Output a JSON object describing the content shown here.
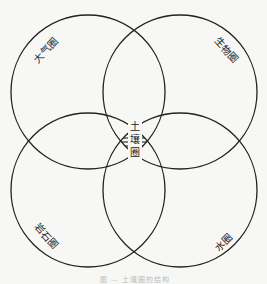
{
  "diagram": {
    "type": "venn-4-circle",
    "circles": [
      {
        "id": "atmosphere",
        "label": "大气圈",
        "cx": 88,
        "cy": 92,
        "r": 77
      },
      {
        "id": "biosphere",
        "label": "生物圈",
        "cx": 180,
        "cy": 92,
        "r": 77
      },
      {
        "id": "lithosphere",
        "label": "岩石圈",
        "cx": 88,
        "cy": 190,
        "r": 77
      },
      {
        "id": "hydrosphere",
        "label": "水圈",
        "cx": 180,
        "cy": 190,
        "r": 77
      }
    ],
    "center": {
      "label": "土壤圈",
      "chars": [
        "土",
        "壤",
        "圈"
      ],
      "fill": "hatched"
    },
    "caption": "图 — 土壤圈的结构",
    "colors": {
      "stroke": "#222222",
      "background": "#f7f7f5",
      "hatch": "#333333"
    }
  }
}
